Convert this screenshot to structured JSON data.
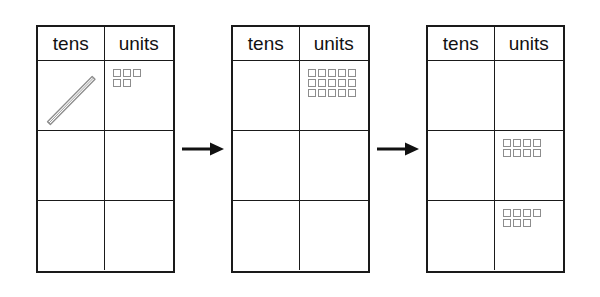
{
  "diagram": {
    "column_headers": [
      "tens",
      "units"
    ],
    "arrow_glyph": "arrow-right",
    "colors": {
      "border": "#1a1a1a",
      "unit_square_outline": "#8d8d8d",
      "rod_outline": "#8d8d8d",
      "background": "#ffffff"
    },
    "tables": [
      {
        "name": "table-1",
        "label": "Start: one ten rod and five units",
        "header": [
          "tens",
          "units"
        ],
        "rows": [
          {
            "name": "row-1",
            "tens": {
              "rod": true,
              "rod_count": 1
            },
            "units": {
              "rows": [
                3,
                2
              ],
              "total": 5
            }
          },
          {
            "name": "row-2",
            "tens": {
              "rod": false,
              "rod_count": 0
            },
            "units": {
              "rows": [],
              "total": 0
            }
          },
          {
            "name": "row-3",
            "tens": {
              "rod": false,
              "rod_count": 0
            },
            "units": {
              "rows": [],
              "total": 0
            }
          }
        ]
      },
      {
        "name": "table-2",
        "label": "After exchange: fifteen units",
        "header": [
          "tens",
          "units"
        ],
        "rows": [
          {
            "name": "row-1",
            "tens": {
              "rod": false,
              "rod_count": 0
            },
            "units": {
              "rows": [
                5,
                5,
                5
              ],
              "total": 15
            }
          },
          {
            "name": "row-2",
            "tens": {
              "rod": false,
              "rod_count": 0
            },
            "units": {
              "rows": [],
              "total": 0
            }
          },
          {
            "name": "row-3",
            "tens": {
              "rod": false,
              "rod_count": 0
            },
            "units": {
              "rows": [],
              "total": 0
            }
          }
        ]
      },
      {
        "name": "table-3",
        "label": "Split into eight and seven units",
        "header": [
          "tens",
          "units"
        ],
        "rows": [
          {
            "name": "row-1",
            "tens": {
              "rod": false,
              "rod_count": 0
            },
            "units": {
              "rows": [],
              "total": 0
            }
          },
          {
            "name": "row-2",
            "tens": {
              "rod": false,
              "rod_count": 0
            },
            "units": {
              "rows": [
                4,
                4
              ],
              "total": 8
            }
          },
          {
            "name": "row-3",
            "tens": {
              "rod": false,
              "rod_count": 0
            },
            "units": {
              "rows": [
                4,
                3
              ],
              "total": 7
            }
          }
        ]
      }
    ]
  }
}
